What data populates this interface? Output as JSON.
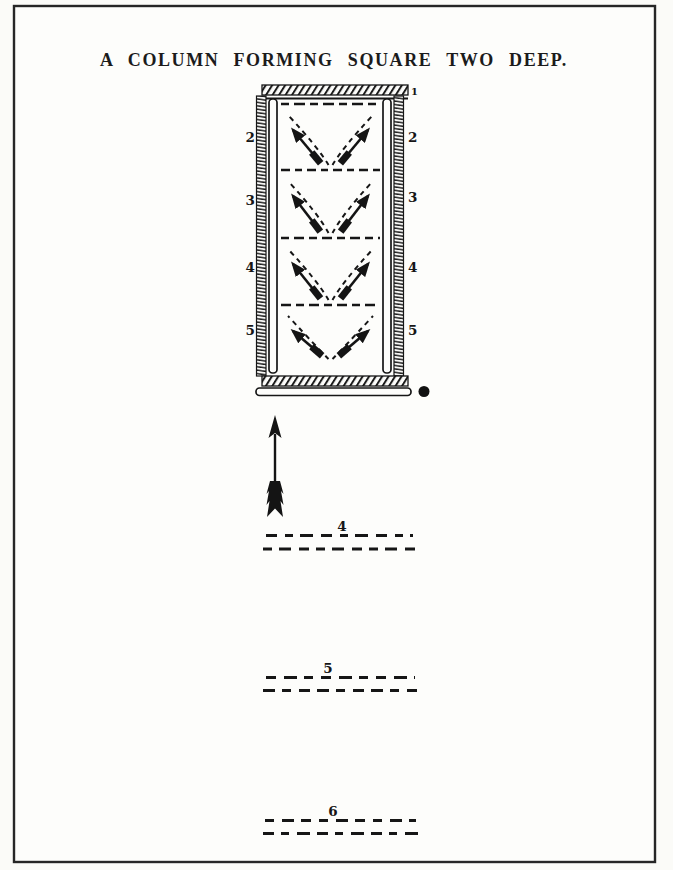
{
  "page": {
    "title": "A COLUMN FORMING SQUARE TWO DEEP.",
    "ink_color": "#1b1b1b",
    "paper_color": "#fbfbf8"
  },
  "column_figure": {
    "compartment_count": 4,
    "front_label": "1",
    "left_flank_labels": [
      "2",
      "3",
      "4",
      "5"
    ],
    "right_flank_labels": [
      "2",
      "3",
      "4",
      "5"
    ],
    "rear_marker": "●"
  },
  "advance_arrow": {
    "direction": "up"
  },
  "rear_company_lines": [
    {
      "label": "4"
    },
    {
      "label": "5"
    },
    {
      "label": "6"
    }
  ]
}
